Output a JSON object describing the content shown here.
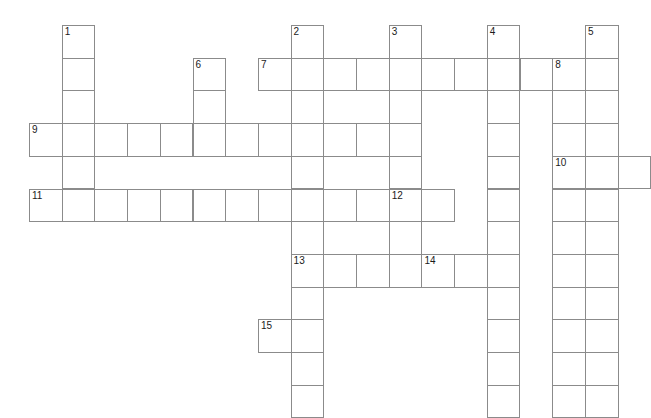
{
  "puzzle": {
    "title": "Crossword Grid",
    "type": "crossword",
    "grid": {
      "columns": 19,
      "rows": 12,
      "cell_size": 32.7,
      "origin_x": 29,
      "origin_y": 25,
      "cell_fill_color": "#ffffff",
      "cell_border_color": "#8b8b8b",
      "background_color": "#ffffff",
      "number_color": "#1b1b1b"
    },
    "entries": [
      {
        "number": "1",
        "direction": "down",
        "col": 1,
        "row": 0,
        "length": 7
      },
      {
        "number": "2",
        "direction": "down",
        "col": 8,
        "row": 0,
        "length": 12
      },
      {
        "number": "3",
        "direction": "down",
        "col": 11,
        "row": 0,
        "length": 8
      },
      {
        "number": "4",
        "direction": "down",
        "col": 14,
        "row": 0,
        "length": 12
      },
      {
        "number": "5",
        "direction": "down",
        "col": 17,
        "row": 0,
        "length": 12
      },
      {
        "number": "6",
        "direction": "down",
        "col": 5,
        "row": 1,
        "length": 4
      },
      {
        "number": "7",
        "direction": "across",
        "col": 7,
        "row": 1,
        "length": 11
      },
      {
        "number": "8",
        "direction": "down",
        "col": 16,
        "row": 1,
        "length": 11
      },
      {
        "number": "9",
        "direction": "across",
        "col": 0,
        "row": 3,
        "length": 11
      },
      {
        "number": "10",
        "direction": "across",
        "col": 16,
        "row": 4,
        "length": 3
      },
      {
        "number": "11",
        "direction": "across",
        "col": 0,
        "row": 5,
        "length": 13
      },
      {
        "number": "12",
        "direction": "across",
        "col": 11,
        "row": 5,
        "length": 3
      },
      {
        "number": "13",
        "direction": "across",
        "col": 8,
        "row": 7,
        "length": 3
      },
      {
        "number": "14",
        "direction": "across",
        "col": 12,
        "row": 7,
        "length": 2
      },
      {
        "number": "15",
        "direction": "across",
        "col": 7,
        "row": 9,
        "length": 2
      }
    ],
    "cells": [
      {
        "col": 1,
        "row": 0,
        "number": "1"
      },
      {
        "col": 8,
        "row": 0,
        "number": "2"
      },
      {
        "col": 11,
        "row": 0,
        "number": "3"
      },
      {
        "col": 14,
        "row": 0,
        "number": "4"
      },
      {
        "col": 17,
        "row": 0,
        "number": "5"
      },
      {
        "col": 1,
        "row": 1,
        "number": ""
      },
      {
        "col": 5,
        "row": 1,
        "number": "6"
      },
      {
        "col": 7,
        "row": 1,
        "number": "7"
      },
      {
        "col": 8,
        "row": 1,
        "number": ""
      },
      {
        "col": 9,
        "row": 1,
        "number": ""
      },
      {
        "col": 10,
        "row": 1,
        "number": ""
      },
      {
        "col": 11,
        "row": 1,
        "number": ""
      },
      {
        "col": 12,
        "row": 1,
        "number": ""
      },
      {
        "col": 13,
        "row": 1,
        "number": ""
      },
      {
        "col": 14,
        "row": 1,
        "number": ""
      },
      {
        "col": 15,
        "row": 1,
        "number": ""
      },
      {
        "col": 16,
        "row": 1,
        "number": "8"
      },
      {
        "col": 17,
        "row": 1,
        "number": ""
      },
      {
        "col": 1,
        "row": 2,
        "number": ""
      },
      {
        "col": 5,
        "row": 2,
        "number": ""
      },
      {
        "col": 8,
        "row": 2,
        "number": ""
      },
      {
        "col": 11,
        "row": 2,
        "number": ""
      },
      {
        "col": 14,
        "row": 2,
        "number": ""
      },
      {
        "col": 16,
        "row": 2,
        "number": ""
      },
      {
        "col": 17,
        "row": 2,
        "number": ""
      },
      {
        "col": 0,
        "row": 3,
        "number": "9"
      },
      {
        "col": 1,
        "row": 3,
        "number": ""
      },
      {
        "col": 2,
        "row": 3,
        "number": ""
      },
      {
        "col": 3,
        "row": 3,
        "number": ""
      },
      {
        "col": 4,
        "row": 3,
        "number": ""
      },
      {
        "col": 5,
        "row": 3,
        "number": ""
      },
      {
        "col": 6,
        "row": 3,
        "number": ""
      },
      {
        "col": 7,
        "row": 3,
        "number": ""
      },
      {
        "col": 8,
        "row": 3,
        "number": ""
      },
      {
        "col": 9,
        "row": 3,
        "number": ""
      },
      {
        "col": 10,
        "row": 3,
        "number": ""
      },
      {
        "col": 11,
        "row": 3,
        "number": ""
      },
      {
        "col": 14,
        "row": 3,
        "number": ""
      },
      {
        "col": 16,
        "row": 3,
        "number": ""
      },
      {
        "col": 17,
        "row": 3,
        "number": ""
      },
      {
        "col": 1,
        "row": 4,
        "number": ""
      },
      {
        "col": 8,
        "row": 4,
        "number": ""
      },
      {
        "col": 11,
        "row": 4,
        "number": ""
      },
      {
        "col": 14,
        "row": 4,
        "number": ""
      },
      {
        "col": 16,
        "row": 4,
        "number": "10"
      },
      {
        "col": 17,
        "row": 4,
        "number": ""
      },
      {
        "col": 18,
        "row": 4,
        "number": ""
      },
      {
        "col": 0,
        "row": 5,
        "number": "11"
      },
      {
        "col": 1,
        "row": 5,
        "number": ""
      },
      {
        "col": 2,
        "row": 5,
        "number": ""
      },
      {
        "col": 3,
        "row": 5,
        "number": ""
      },
      {
        "col": 4,
        "row": 5,
        "number": ""
      },
      {
        "col": 5,
        "row": 5,
        "number": ""
      },
      {
        "col": 6,
        "row": 5,
        "number": ""
      },
      {
        "col": 7,
        "row": 5,
        "number": ""
      },
      {
        "col": 8,
        "row": 5,
        "number": ""
      },
      {
        "col": 9,
        "row": 5,
        "number": ""
      },
      {
        "col": 10,
        "row": 5,
        "number": ""
      },
      {
        "col": 11,
        "row": 5,
        "number": "12"
      },
      {
        "col": 12,
        "row": 5,
        "number": ""
      },
      {
        "col": 14,
        "row": 5,
        "number": ""
      },
      {
        "col": 16,
        "row": 5,
        "number": ""
      },
      {
        "col": 17,
        "row": 5,
        "number": ""
      },
      {
        "col": 8,
        "row": 6,
        "number": ""
      },
      {
        "col": 11,
        "row": 6,
        "number": ""
      },
      {
        "col": 14,
        "row": 6,
        "number": ""
      },
      {
        "col": 16,
        "row": 6,
        "number": ""
      },
      {
        "col": 17,
        "row": 6,
        "number": ""
      },
      {
        "col": 8,
        "row": 7,
        "number": "13"
      },
      {
        "col": 9,
        "row": 7,
        "number": ""
      },
      {
        "col": 10,
        "row": 7,
        "number": ""
      },
      {
        "col": 11,
        "row": 7,
        "number": ""
      },
      {
        "col": 12,
        "row": 7,
        "number": "14"
      },
      {
        "col": 13,
        "row": 7,
        "number": ""
      },
      {
        "col": 14,
        "row": 7,
        "number": ""
      },
      {
        "col": 16,
        "row": 7,
        "number": ""
      },
      {
        "col": 17,
        "row": 7,
        "number": ""
      },
      {
        "col": 8,
        "row": 8,
        "number": ""
      },
      {
        "col": 14,
        "row": 8,
        "number": ""
      },
      {
        "col": 16,
        "row": 8,
        "number": ""
      },
      {
        "col": 17,
        "row": 8,
        "number": ""
      },
      {
        "col": 7,
        "row": 9,
        "number": "15"
      },
      {
        "col": 8,
        "row": 9,
        "number": ""
      },
      {
        "col": 14,
        "row": 9,
        "number": ""
      },
      {
        "col": 16,
        "row": 9,
        "number": ""
      },
      {
        "col": 17,
        "row": 9,
        "number": ""
      },
      {
        "col": 8,
        "row": 10,
        "number": ""
      },
      {
        "col": 14,
        "row": 10,
        "number": ""
      },
      {
        "col": 16,
        "row": 10,
        "number": ""
      },
      {
        "col": 17,
        "row": 10,
        "number": ""
      },
      {
        "col": 8,
        "row": 11,
        "number": ""
      },
      {
        "col": 14,
        "row": 11,
        "number": ""
      },
      {
        "col": 16,
        "row": 11,
        "number": ""
      },
      {
        "col": 17,
        "row": 11,
        "number": ""
      }
    ]
  }
}
